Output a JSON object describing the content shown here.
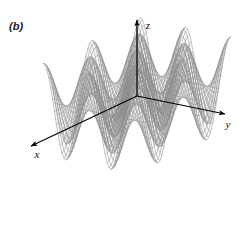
{
  "figure": {
    "panel_label": "(b)",
    "background_color": "#ffffff",
    "mesh_color": "#8c8c8c",
    "axis_color": "#000000",
    "width": 247,
    "height": 247
  },
  "axes": {
    "x": {
      "label": "x",
      "label_x": 37,
      "label_y": 158,
      "tip_x": 31,
      "tip_y": 146,
      "origin_x": 137,
      "origin_y": 96
    },
    "y": {
      "label": "y",
      "label_x": 228,
      "label_y": 128,
      "tip_x": 225,
      "tip_y": 114,
      "origin_x": 137,
      "origin_y": 96
    },
    "z": {
      "label": "z",
      "label_x": 148,
      "label_y": 29,
      "tip_x": 137,
      "tip_y": 20,
      "origin_x": 137,
      "origin_y": 96
    }
  },
  "chart_data": {
    "type": "surface",
    "title": "",
    "panel": "(b)",
    "function": "z = cos(x) * cos(y)",
    "xlabel": "x",
    "ylabel": "y",
    "zlabel": "z",
    "xlim": [
      -6.2831853,
      6.2831853
    ],
    "ylim": [
      -6.2831853,
      6.2831853
    ],
    "zlim": [
      -1,
      1
    ],
    "grid": true,
    "legend": null,
    "mesh": {
      "u_samples": 49,
      "v_samples": 49,
      "style": "wireframe"
    },
    "projection": {
      "type": "oblique-axonometric",
      "origin_px": [
        137,
        96
      ],
      "x_axis_px": [
        -0.905,
        0.425
      ],
      "y_axis_px": [
        0.978,
        0.207
      ],
      "z_axis_px": [
        0.0,
        -1.0
      ],
      "x_scale": 8.55,
      "y_scale": 7.35,
      "z_scale": 46
    },
    "features": {
      "peaks": 5,
      "valleys": 4,
      "description": "Doubly periodic egg-carton surface with a central peak under the z-axis, two tall side peaks and intervening troughs."
    }
  }
}
